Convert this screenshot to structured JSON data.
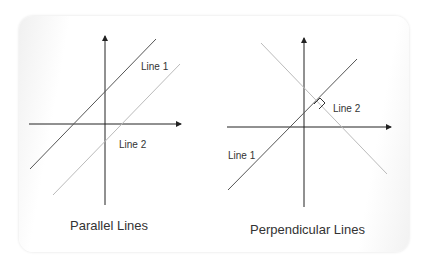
{
  "diagrams": {
    "parallel": {
      "title": "Parallel Lines",
      "line1_label": "Line 1",
      "line2_label": "Line 2"
    },
    "perpendicular": {
      "title": "Perpendicular Lines",
      "line1_label": "Line 1",
      "line2_label": "Line 2"
    }
  },
  "colors": {
    "axis": "#222222",
    "line_dark": "#555555",
    "line_light": "#bbbbbb"
  }
}
